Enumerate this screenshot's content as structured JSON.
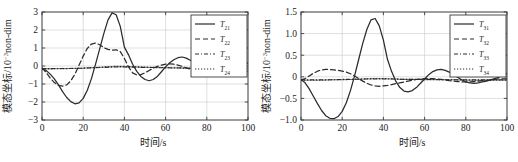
{
  "figure": {
    "panel_count": 2,
    "background": "#ffffff",
    "line_color": "#2b2b2b",
    "grid_color": "#c9c9c9",
    "axis_color": "#3b3b3b"
  },
  "chart_data": [
    {
      "id": "left-panel",
      "type": "line",
      "title": "",
      "xlabel": "时间/s",
      "ylabel": "模态坐标/10⁻³non-dim",
      "ylabel_parts": {
        "main": "模态坐标/10",
        "exponent": "-3",
        "tail": "non-dim"
      },
      "xlim": [
        0,
        100
      ],
      "ylim": [
        -3,
        3
      ],
      "xticks": [
        0,
        20,
        40,
        60,
        80,
        100
      ],
      "yticks": [
        -3,
        -2,
        -1,
        0,
        1,
        2,
        3
      ],
      "xticklabels": [
        "0",
        "20",
        "40",
        "60",
        "80",
        "100"
      ],
      "yticklabels": [
        "-3",
        "-2",
        "-1",
        "0",
        "1",
        "2",
        "3"
      ],
      "grid": true,
      "legend_position": "upper-right",
      "series": [
        {
          "name": "T21",
          "label_base": "T",
          "label_sub": "21",
          "style": "s-solid",
          "x": [
            0,
            2,
            4,
            6,
            8,
            10,
            12,
            14,
            16,
            18,
            20,
            22,
            24,
            26,
            28,
            30,
            32,
            34,
            36,
            38,
            40,
            42,
            44,
            46,
            48,
            50,
            52,
            54,
            56,
            58,
            60,
            62,
            64,
            66,
            68,
            70,
            72,
            74,
            76,
            78,
            80,
            82,
            84,
            86,
            88,
            90,
            92,
            94,
            96,
            98,
            100
          ],
          "y": [
            -0.15,
            -0.25,
            -0.45,
            -0.72,
            -1.05,
            -1.42,
            -1.75,
            -1.98,
            -2.1,
            -2.05,
            -1.8,
            -1.35,
            -0.7,
            0.1,
            0.95,
            1.8,
            2.55,
            2.95,
            2.85,
            2.2,
            1.05,
            0.62,
            0.1,
            -0.3,
            -0.58,
            -0.75,
            -0.82,
            -0.75,
            -0.58,
            -0.32,
            -0.05,
            0.18,
            0.35,
            0.46,
            0.5,
            0.44,
            0.32,
            0.16,
            0.0,
            -0.14,
            -0.25,
            -0.32,
            -0.34,
            -0.32,
            -0.28,
            -0.22,
            -0.16,
            -0.1,
            -0.04,
            0.04,
            0.18
          ]
        },
        {
          "name": "T22",
          "label_base": "T",
          "label_sub": "22",
          "style": "s-dashed",
          "x": [
            0,
            2,
            4,
            6,
            8,
            10,
            12,
            14,
            16,
            18,
            20,
            22,
            24,
            26,
            28,
            30,
            32,
            34,
            36,
            38,
            40,
            42,
            44,
            46,
            48,
            50,
            52,
            54,
            56,
            58,
            60,
            62,
            64,
            66,
            68,
            70,
            72,
            74,
            76,
            78,
            80,
            82,
            84,
            86,
            88,
            90,
            92,
            94,
            96,
            98,
            100
          ],
          "y": [
            -0.1,
            -0.35,
            -0.68,
            -0.92,
            -1.08,
            -1.12,
            -1.05,
            -0.82,
            -0.45,
            0.05,
            0.55,
            0.98,
            1.22,
            1.28,
            1.18,
            1.02,
            0.92,
            0.88,
            0.9,
            0.8,
            0.42,
            -0.05,
            -0.38,
            -0.5,
            -0.48,
            -0.38,
            -0.25,
            -0.12,
            -0.02,
            0.05,
            0.1,
            0.12,
            0.1,
            0.05,
            -0.02,
            -0.1,
            -0.18,
            -0.25,
            -0.3,
            -0.33,
            -0.35,
            -0.36,
            -0.35,
            -0.33,
            -0.3,
            -0.28,
            -0.25,
            -0.24,
            -0.24,
            -0.25,
            -0.28
          ]
        },
        {
          "name": "T23",
          "label_base": "T",
          "label_sub": "23",
          "style": "s-dashdot",
          "x": [
            0,
            5,
            10,
            15,
            20,
            25,
            30,
            35,
            40,
            45,
            50,
            55,
            60,
            65,
            70,
            75,
            80,
            85,
            90,
            95,
            100
          ],
          "y": [
            -0.14,
            -0.14,
            -0.14,
            -0.13,
            -0.12,
            -0.1,
            -0.08,
            -0.06,
            -0.06,
            -0.07,
            -0.08,
            -0.09,
            -0.1,
            -0.11,
            -0.12,
            -0.12,
            -0.13,
            -0.13,
            -0.13,
            -0.13,
            -0.13
          ]
        },
        {
          "name": "T24",
          "label_base": "T",
          "label_sub": "24",
          "style": "s-dotted",
          "x": [
            0,
            5,
            10,
            15,
            20,
            25,
            30,
            35,
            40,
            45,
            50,
            55,
            60,
            65,
            70,
            75,
            80,
            85,
            90,
            95,
            100
          ],
          "y": [
            -0.16,
            -0.16,
            -0.15,
            -0.14,
            -0.12,
            -0.09,
            -0.05,
            -0.02,
            -0.02,
            -0.04,
            -0.06,
            -0.08,
            -0.09,
            -0.1,
            -0.11,
            -0.12,
            -0.12,
            -0.13,
            -0.13,
            -0.13,
            -0.13
          ]
        }
      ]
    },
    {
      "id": "right-panel",
      "type": "line",
      "title": "",
      "xlabel": "时间/s",
      "ylabel": "模态坐标/10⁻³non-dim",
      "ylabel_parts": {
        "main": "模态坐标/10",
        "exponent": "-3",
        "tail": "non-dim"
      },
      "xlim": [
        0,
        100
      ],
      "ylim": [
        -1.0,
        1.5
      ],
      "xticks": [
        0,
        20,
        40,
        60,
        80,
        100
      ],
      "yticks": [
        -1.0,
        -0.5,
        0,
        0.5,
        1.0,
        1.5
      ],
      "xticklabels": [
        "0",
        "20",
        "40",
        "60",
        "80",
        "100"
      ],
      "yticklabels": [
        "-1.0",
        "-0.5",
        "0",
        "0.5",
        "1.0",
        "1.5"
      ],
      "grid": true,
      "legend_position": "upper-right",
      "series": [
        {
          "name": "T31",
          "label_base": "T",
          "label_sub": "31",
          "style": "s-solid",
          "x": [
            0,
            2,
            4,
            6,
            8,
            10,
            12,
            14,
            16,
            18,
            20,
            22,
            24,
            26,
            28,
            30,
            32,
            34,
            36,
            38,
            40,
            42,
            44,
            46,
            48,
            50,
            52,
            54,
            56,
            58,
            60,
            62,
            64,
            66,
            68,
            70,
            72,
            74,
            76,
            78,
            80,
            82,
            84,
            86,
            88,
            90,
            92,
            94,
            96,
            98,
            100
          ],
          "y": [
            -0.06,
            -0.14,
            -0.28,
            -0.45,
            -0.62,
            -0.78,
            -0.9,
            -0.96,
            -0.97,
            -0.92,
            -0.8,
            -0.6,
            -0.32,
            0.02,
            0.4,
            0.78,
            1.1,
            1.32,
            1.35,
            1.18,
            0.85,
            0.4,
            0.12,
            -0.1,
            -0.25,
            -0.33,
            -0.35,
            -0.32,
            -0.25,
            -0.15,
            -0.05,
            0.05,
            0.12,
            0.16,
            0.17,
            0.15,
            0.11,
            0.05,
            -0.01,
            -0.07,
            -0.12,
            -0.14,
            -0.15,
            -0.14,
            -0.12,
            -0.1,
            -0.07,
            -0.04,
            -0.01,
            0.03,
            0.08
          ]
        },
        {
          "name": "T32",
          "label_base": "T",
          "label_sub": "32",
          "style": "s-dashed",
          "x": [
            0,
            2,
            4,
            6,
            8,
            10,
            12,
            14,
            16,
            18,
            20,
            22,
            24,
            26,
            28,
            30,
            32,
            34,
            36,
            38,
            40,
            42,
            44,
            46,
            48,
            50,
            52,
            54,
            56,
            58,
            60,
            62,
            64,
            66,
            68,
            70,
            72,
            74,
            76,
            78,
            80,
            82,
            84,
            86,
            88,
            90,
            92,
            94,
            96,
            98,
            100
          ],
          "y": [
            -0.07,
            -0.04,
            0.02,
            0.08,
            0.13,
            0.16,
            0.17,
            0.17,
            0.16,
            0.15,
            0.13,
            0.11,
            0.07,
            0.02,
            -0.04,
            -0.1,
            -0.15,
            -0.19,
            -0.21,
            -0.22,
            -0.21,
            -0.2,
            -0.18,
            -0.16,
            -0.14,
            -0.12,
            -0.1,
            -0.08,
            -0.06,
            -0.05,
            -0.04,
            -0.04,
            -0.04,
            -0.05,
            -0.06,
            -0.07,
            -0.09,
            -0.1,
            -0.11,
            -0.12,
            -0.12,
            -0.12,
            -0.11,
            -0.1,
            -0.09,
            -0.08,
            -0.07,
            -0.06,
            -0.05,
            -0.05,
            -0.05
          ]
        },
        {
          "name": "T33",
          "label_base": "T",
          "label_sub": "33",
          "style": "s-dashdot",
          "x": [
            0,
            5,
            10,
            15,
            20,
            25,
            30,
            35,
            40,
            45,
            50,
            55,
            60,
            65,
            70,
            75,
            80,
            85,
            90,
            95,
            100
          ],
          "y": [
            -0.07,
            -0.07,
            -0.07,
            -0.07,
            -0.06,
            -0.06,
            -0.05,
            -0.05,
            -0.05,
            -0.05,
            -0.06,
            -0.06,
            -0.06,
            -0.06,
            -0.07,
            -0.07,
            -0.07,
            -0.07,
            -0.07,
            -0.07,
            -0.07
          ]
        },
        {
          "name": "T34",
          "label_base": "T",
          "label_sub": "34",
          "style": "s-dotted",
          "x": [
            0,
            5,
            10,
            15,
            20,
            25,
            30,
            35,
            40,
            45,
            50,
            55,
            60,
            65,
            70,
            75,
            80,
            85,
            90,
            95,
            100
          ],
          "y": [
            -0.08,
            -0.08,
            -0.08,
            -0.07,
            -0.07,
            -0.06,
            -0.05,
            -0.04,
            -0.04,
            -0.05,
            -0.06,
            -0.06,
            -0.07,
            -0.07,
            -0.07,
            -0.07,
            -0.08,
            -0.08,
            -0.08,
            -0.08,
            -0.08
          ]
        }
      ]
    }
  ]
}
